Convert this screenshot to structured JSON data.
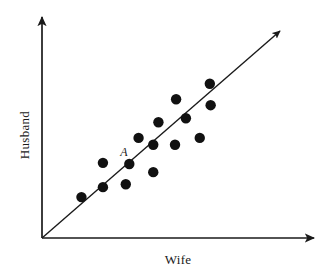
{
  "chart_data": {
    "type": "scatter",
    "title": "",
    "subtitle": "",
    "xlabel": "Wife",
    "ylabel": "Husband",
    "xlim": [
      0,
      100
    ],
    "ylim": [
      0,
      100
    ],
    "grid": false,
    "legend": null,
    "axis_ticks": {
      "x": [],
      "y": []
    },
    "points": [
      {
        "id": "p1",
        "x": 14.5,
        "y": 18.5,
        "label": ""
      },
      {
        "id": "p2",
        "x": 22.4,
        "y": 23.0,
        "label": ""
      },
      {
        "id": "p3",
        "x": 22.4,
        "y": 34.0,
        "label": ""
      },
      {
        "id": "p4",
        "x": 30.8,
        "y": 24.3,
        "label": ""
      },
      {
        "id": "A",
        "x": 32.1,
        "y": 33.5,
        "label": "A"
      },
      {
        "id": "p6",
        "x": 35.5,
        "y": 45.3,
        "label": ""
      },
      {
        "id": "p7",
        "x": 40.9,
        "y": 42.2,
        "label": ""
      },
      {
        "id": "p8",
        "x": 40.9,
        "y": 29.8,
        "label": ""
      },
      {
        "id": "p9",
        "x": 42.8,
        "y": 52.4,
        "label": ""
      },
      {
        "id": "p10",
        "x": 48.9,
        "y": 42.2,
        "label": ""
      },
      {
        "id": "p11",
        "x": 49.3,
        "y": 62.8,
        "label": ""
      },
      {
        "id": "p12",
        "x": 52.9,
        "y": 54.2,
        "label": ""
      },
      {
        "id": "p13",
        "x": 58.0,
        "y": 45.3,
        "label": ""
      },
      {
        "id": "p14",
        "x": 61.7,
        "y": 69.8,
        "label": ""
      },
      {
        "id": "p15",
        "x": 62.0,
        "y": 60.1,
        "label": ""
      }
    ],
    "reference_line": {
      "name": "equality-line",
      "from": [
        0,
        0
      ],
      "to": [
        100,
        100
      ],
      "arrow": true,
      "style": "solid"
    },
    "colors": {
      "point": "#111111",
      "axis": "#1a1a1a",
      "line": "#1a1a1a",
      "background": "#ffffff"
    },
    "point_radius_px": 5.2
  },
  "figure": {
    "y_axis_name": "husband-axis",
    "x_axis_name": "wife-axis"
  }
}
